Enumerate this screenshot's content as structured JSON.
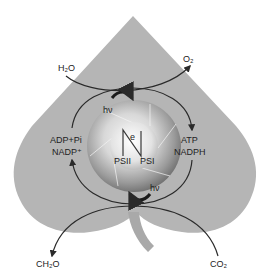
{
  "diagram": {
    "colors": {
      "leaf": "#b5b5b5",
      "stem": "#a9a9a9",
      "line": "#2a2a2a",
      "sphere_light": "#f2f2f2",
      "sphere_dark": "#7a7a7a",
      "background": "#ffffff"
    },
    "labels": {
      "h2o": "H₂O",
      "o2": "O₂",
      "hv_top": "hν",
      "hv_bottom": "hν",
      "adp_pi": "ADP+Pi",
      "nadp_plus": "NADP⁺",
      "atp": "ATP",
      "nadph": "NADPH",
      "electron": "e",
      "psii": "PSII",
      "psi": "PSI",
      "ch2o": "CH₂O",
      "co2": "CO₂"
    },
    "flows": [
      {
        "from": "H₂O",
        "to": "O₂",
        "direction": "left-to-right"
      },
      {
        "from": "ADP+Pi / NADP⁺",
        "to": "ATP / NADPH",
        "direction": "clockwise (light reactions)"
      },
      {
        "from": "CO₂",
        "to": "CH₂O",
        "direction": "right-to-left"
      }
    ]
  }
}
